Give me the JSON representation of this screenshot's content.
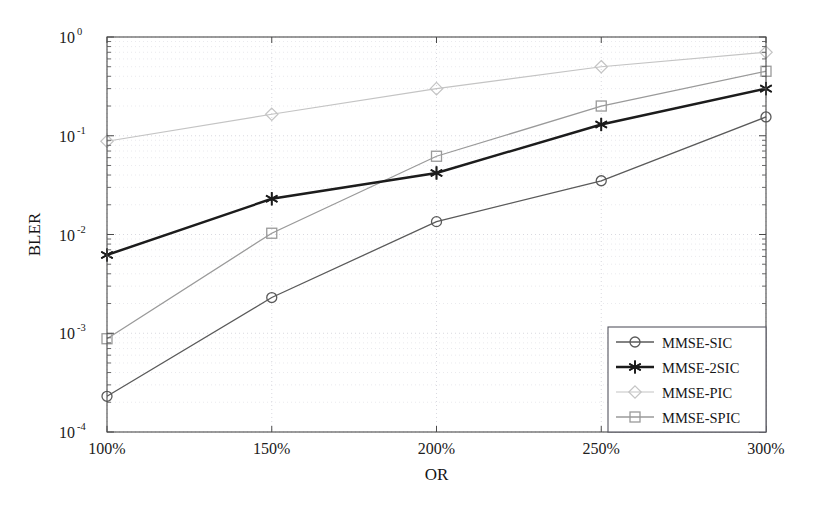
{
  "figure": {
    "background_color": "#ffffff",
    "plot_box": {
      "left": 107,
      "top": 37,
      "right": 766,
      "bottom": 432
    }
  },
  "axes": {
    "ylabel": "BLER",
    "xlabel": "OR",
    "y_tick_labels": [
      {
        "mantissa": "10",
        "exponent": "0"
      },
      {
        "mantissa": "10",
        "exponent": "-1"
      },
      {
        "mantissa": "10",
        "exponent": "-2"
      },
      {
        "mantissa": "10",
        "exponent": "-3"
      },
      {
        "mantissa": "10",
        "exponent": "-4"
      }
    ],
    "x_tick_labels": [
      "100%",
      "150%",
      "200%",
      "250%",
      "300%"
    ]
  },
  "legend": {
    "position": "bottom-right",
    "entries": [
      {
        "label": "MMSE-SIC",
        "marker": "circle",
        "color": "#5a5a5a",
        "line_width": 1.3
      },
      {
        "label": "MMSE-2SIC",
        "marker": "asterisk",
        "color": "#1c1c1c",
        "line_width": 2.4
      },
      {
        "label": "MMSE-PIC",
        "marker": "diamond",
        "color": "#c4c4c4",
        "line_width": 1.2
      },
      {
        "label": "MMSE-SPIC",
        "marker": "square",
        "color": "#9a9a9a",
        "line_width": 1.3
      }
    ]
  },
  "chart_data": {
    "type": "line",
    "title": "",
    "xlabel": "OR",
    "ylabel": "BLER",
    "yscale": "log",
    "ylim": [
      0.0001,
      1
    ],
    "grid": true,
    "legend_position": "lower right",
    "categories": [
      "100%",
      "150%",
      "200%",
      "250%",
      "300%"
    ],
    "x": [
      100,
      150,
      200,
      250,
      300
    ],
    "series": [
      {
        "name": "MMSE-SIC",
        "marker": "circle",
        "color": "#5a5a5a",
        "values": [
          0.00023,
          0.0023,
          0.0135,
          0.035,
          0.155
        ]
      },
      {
        "name": "MMSE-2SIC",
        "marker": "asterisk",
        "color": "#1c1c1c",
        "values": [
          0.0062,
          0.023,
          0.042,
          0.13,
          0.3
        ]
      },
      {
        "name": "MMSE-PIC",
        "marker": "diamond",
        "color": "#c4c4c4",
        "values": [
          0.088,
          0.165,
          0.3,
          0.5,
          0.7
        ]
      },
      {
        "name": "MMSE-SPIC",
        "marker": "square",
        "color": "#9a9a9a",
        "values": [
          0.00088,
          0.0103,
          0.062,
          0.2,
          0.45
        ]
      }
    ]
  }
}
